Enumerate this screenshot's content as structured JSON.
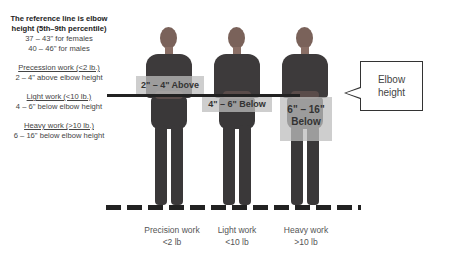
{
  "legend": {
    "title_line1": "The reference line is elbow",
    "title_line2": "height (5th–9th percentile)",
    "females": "37 – 43\" for females",
    "males": "40 – 46\" for males",
    "items": [
      {
        "heading": "Precession work (<2 lb.)",
        "detail": "2 – 4\" above elbow height"
      },
      {
        "heading": "Light work (<10 lb.)",
        "detail": "4 – 6\" below elbow height"
      },
      {
        "heading": "Heavy work (>10 lb.)",
        "detail": "6 – 16\" below elbow height"
      }
    ]
  },
  "boxes": {
    "precision": "2\" – 4\" Above",
    "light": "4\" – 6\" Below",
    "heavy_line1": "6\" – 16\"",
    "heavy_line2": "Below"
  },
  "callout": {
    "line1": "Elbow",
    "line2": "height"
  },
  "captions": [
    {
      "line1": "Precision work",
      "line2": "<2 lb"
    },
    {
      "line1": "Light work",
      "line2": "<10 lb"
    },
    {
      "line1": "Heavy work",
      "line2": ">10 lb"
    }
  ]
}
